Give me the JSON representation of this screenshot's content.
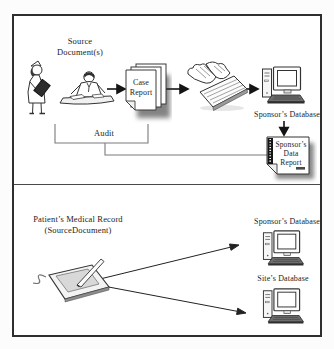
{
  "colors": {
    "ink": "#1f1f1f",
    "connector_gray": "#7a7a7a",
    "frame_border": "#2e2e2e",
    "paper": "#ffffff",
    "shadow": "#3a3a3a"
  },
  "top_section": {
    "source_documents_label": "Source\nDocument(s)",
    "case_report_label": "Case\nReport",
    "audit_label": "Audit",
    "sponsors_database_label": "Sponsor’s Database",
    "sponsors_data_report_label": "Sponsor’s\nData\nReport"
  },
  "bottom_section": {
    "patients_medical_record_label": "Patient’s Medical Record\n(SourceDocument)",
    "sponsors_database_label": "Sponsor’s Database",
    "sites_database_label": "Site’s Database"
  },
  "icons": {
    "nurse": "nurse-with-chart-icon",
    "doctor": "clinician-writing-at-desk-icon",
    "keyboard": "hands-typing-on-keyboard-icon",
    "computer": "desktop-computer-icon",
    "tablet": "electronic-tablet-with-stylus-icon",
    "case_report": "stacked-pages-document-icon",
    "data_report": "bound-report-document-icon",
    "arrows": "solid-black-arrow"
  }
}
